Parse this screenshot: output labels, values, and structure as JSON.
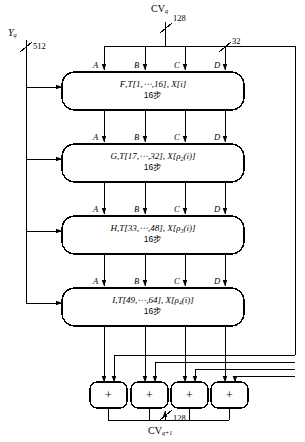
{
  "diagram": {
    "top_input": {
      "name": "CV",
      "sub": "q",
      "bitwidth": "128"
    },
    "left_input": {
      "name": "Y",
      "sub": "q",
      "bitwidth": "512"
    },
    "branch_bitwidth": "32",
    "output": {
      "name": "CV",
      "sub": "q+1",
      "bitwidth": "128"
    },
    "port_labels": [
      "A",
      "B",
      "C",
      "D"
    ],
    "adder_symbol": "+",
    "adders": [
      "adder-a",
      "adder-b",
      "adder-c",
      "adder-d"
    ],
    "rounds": [
      {
        "id": "round-f",
        "func": "F",
        "table": "T[1,⋯,16]",
        "message": "X[i]",
        "steps": "16步"
      },
      {
        "id": "round-g",
        "func": "G",
        "table": "T[17,⋯,32]",
        "message": "X[ρ₂(i)]",
        "steps": "16步"
      },
      {
        "id": "round-h",
        "func": "H",
        "table": "T[33,⋯,48]",
        "message": "X[ρ₃(i)]",
        "steps": "16步"
      },
      {
        "id": "round-i",
        "func": "I",
        "table": "T[49,⋯,64]",
        "message": "X[ρ₄(i)]",
        "steps": "16步"
      }
    ],
    "colors": {
      "line": "#000000",
      "background": "#ffffff"
    }
  }
}
